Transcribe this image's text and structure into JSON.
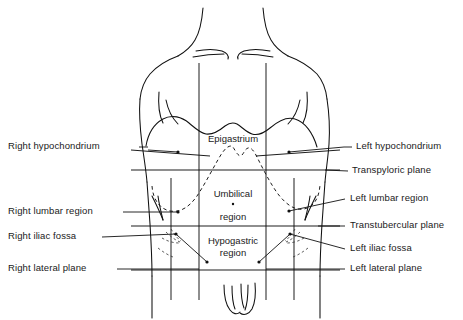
{
  "figure": {
    "type": "anatomical-diagram",
    "view": "anterior"
  },
  "center_labels": [
    {
      "id": "epigastrium",
      "text": "Epigastrium",
      "lines": [
        "Epigastrium"
      ],
      "x": 233,
      "y": 140
    },
    {
      "id": "umbilical",
      "text": "Umbilical region",
      "lines": [
        "Umbilical",
        "region"
      ],
      "x": 233,
      "y": 196
    },
    {
      "id": "hypogastric",
      "text": "Hypogastric region",
      "lines": [
        "Hypogastric",
        "region"
      ],
      "x": 233,
      "y": 243
    }
  ],
  "left_labels": [
    {
      "id": "right-hypochondrium",
      "text": "Right hypochondrium",
      "y": 147
    },
    {
      "id": "right-lumbar-region",
      "text": "Right lumbar region",
      "y": 212
    },
    {
      "id": "right-iliac-fossa",
      "text": "Right iliac fossa",
      "y": 237
    },
    {
      "id": "right-lateral-plane",
      "text": "Right lateral plane",
      "y": 269
    }
  ],
  "right_labels": [
    {
      "id": "left-hypochondrium",
      "text": "Left hypochondrium",
      "y": 147
    },
    {
      "id": "transpyloric-plane",
      "text": "Transpyloric plane",
      "y": 171
    },
    {
      "id": "left-lumbar-region",
      "text": "Left lumbar region",
      "y": 199
    },
    {
      "id": "transtubercular-plane",
      "text": "Transtubercular plane",
      "y": 226
    },
    {
      "id": "left-iliac-fossa",
      "text": "Left iliac fossa",
      "y": 249
    },
    {
      "id": "left-lateral-plane",
      "text": "Left lateral plane",
      "y": 269
    }
  ],
  "planes": {
    "horizontal": [
      {
        "id": "transpyloric",
        "name": "Transpyloric plane",
        "y": 170
      },
      {
        "id": "transtubercular",
        "name": "Transtubercular plane",
        "y": 226
      }
    ],
    "vertical": [
      {
        "id": "right-lateral",
        "name": "Right lateral plane",
        "x": 199
      },
      {
        "id": "left-lateral",
        "name": "Left lateral plane",
        "x": 266
      }
    ]
  },
  "regions": [
    "Right hypochondrium",
    "Epigastrium",
    "Left hypochondrium",
    "Right lumbar region",
    "Umbilical region",
    "Left lumbar region",
    "Right iliac fossa",
    "Hypogastric region",
    "Left iliac fossa"
  ],
  "colors": {
    "ink": "#111111",
    "text": "#1a1a1a",
    "background": "#ffffff"
  }
}
